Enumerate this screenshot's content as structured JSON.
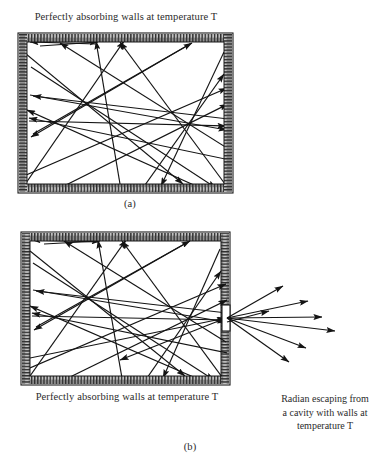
{
  "figure": {
    "title_top": "Perfectly absorbing walls at temperature T",
    "label_a": "(a)",
    "title_bottom": "Perfectly absorbing walls at temperature T",
    "label_b": "(b)",
    "escape_line1": "Radian escaping from",
    "escape_line2": "a cavity with walls at",
    "escape_line3": "temperature T"
  },
  "colors": {
    "ink": "#1a1a1a",
    "text": "#2b2b2b",
    "wall_fill": "#b9b9b9",
    "wall_hatch": "#2a2a2a",
    "cavity_fill": "#ffffff",
    "background": "#ffffff"
  },
  "chart_data": {
    "type": "diagram",
    "panels": [
      {
        "id": "a",
        "label": "(a)",
        "caption": "Perfectly absorbing walls at temperature T",
        "box": {
          "x": 18,
          "y": 33,
          "w": 215,
          "h": 160
        },
        "wall_thickness": 9,
        "aperture": null,
        "description": "Closed cavity with perfectly absorbing walls; radiation rays reflect internally and none escape.",
        "rays": [
          {
            "x1": 96,
            "y1": 44,
            "x2": 30,
            "y2": 42
          },
          {
            "x1": 26,
            "y1": 54,
            "x2": 183,
            "y2": 184
          },
          {
            "x1": 40,
            "y1": 46,
            "x2": 98,
            "y2": 42
          },
          {
            "x1": 120,
            "y1": 184,
            "x2": 96,
            "y2": 41
          },
          {
            "x1": 31,
            "y1": 67,
            "x2": 216,
            "y2": 188
          },
          {
            "x1": 26,
            "y1": 183,
            "x2": 124,
            "y2": 41
          },
          {
            "x1": 224,
            "y1": 52,
            "x2": 161,
            "y2": 186
          },
          {
            "x1": 30,
            "y1": 95,
            "x2": 227,
            "y2": 130
          },
          {
            "x1": 228,
            "y1": 119,
            "x2": 33,
            "y2": 96
          },
          {
            "x1": 190,
            "y1": 44,
            "x2": 31,
            "y2": 137
          },
          {
            "x1": 33,
            "y1": 134,
            "x2": 192,
            "y2": 43
          },
          {
            "x1": 26,
            "y1": 175,
            "x2": 227,
            "y2": 88
          },
          {
            "x1": 225,
            "y1": 184,
            "x2": 120,
            "y2": 42
          },
          {
            "x1": 145,
            "y1": 185,
            "x2": 224,
            "y2": 74
          },
          {
            "x1": 29,
            "y1": 121,
            "x2": 226,
            "y2": 126
          },
          {
            "x1": 227,
            "y1": 148,
            "x2": 60,
            "y2": 43
          },
          {
            "x1": 62,
            "y1": 187,
            "x2": 228,
            "y2": 104
          },
          {
            "x1": 230,
            "y1": 160,
            "x2": 29,
            "y2": 118
          },
          {
            "x1": 196,
            "y1": 186,
            "x2": 27,
            "y2": 110
          }
        ]
      },
      {
        "id": "b",
        "label": "(b)",
        "caption": "Perfectly absorbing walls at temperature T",
        "box": {
          "x": 21,
          "y": 232,
          "w": 209,
          "h": 153
        },
        "wall_thickness": 9,
        "aperture": {
          "x": 222,
          "y": 305,
          "w": 8,
          "h": 26
        },
        "escape_caption": "Radian escaping from a cavity with walls at temperature T",
        "description": "Cavity with a small aperture in the right wall; internal rays converge on the hole and escape as a fan of radiation.",
        "rays": [
          {
            "x1": 98,
            "y1": 242,
            "x2": 32,
            "y2": 240
          },
          {
            "x1": 30,
            "y1": 251,
            "x2": 185,
            "y2": 376
          },
          {
            "x1": 44,
            "y1": 244,
            "x2": 100,
            "y2": 241
          },
          {
            "x1": 122,
            "y1": 378,
            "x2": 98,
            "y2": 240
          },
          {
            "x1": 33,
            "y1": 263,
            "x2": 214,
            "y2": 380
          },
          {
            "x1": 30,
            "y1": 376,
            "x2": 126,
            "y2": 240
          },
          {
            "x1": 220,
            "y1": 249,
            "x2": 163,
            "y2": 378
          },
          {
            "x1": 33,
            "y1": 290,
            "x2": 226,
            "y2": 322
          },
          {
            "x1": 227,
            "y1": 313,
            "x2": 36,
            "y2": 291
          },
          {
            "x1": 188,
            "y1": 242,
            "x2": 34,
            "y2": 330
          },
          {
            "x1": 36,
            "y1": 327,
            "x2": 190,
            "y2": 241
          },
          {
            "x1": 30,
            "y1": 368,
            "x2": 226,
            "y2": 284
          },
          {
            "x1": 222,
            "y1": 377,
            "x2": 122,
            "y2": 241
          },
          {
            "x1": 147,
            "y1": 378,
            "x2": 221,
            "y2": 271
          },
          {
            "x1": 32,
            "y1": 316,
            "x2": 225,
            "y2": 320
          },
          {
            "x1": 226,
            "y1": 342,
            "x2": 64,
            "y2": 241
          },
          {
            "x1": 66,
            "y1": 379,
            "x2": 227,
            "y2": 300
          },
          {
            "x1": 228,
            "y1": 353,
            "x2": 32,
            "y2": 313
          },
          {
            "x1": 198,
            "y1": 379,
            "x2": 30,
            "y2": 306
          },
          {
            "x1": 30,
            "y1": 358,
            "x2": 226,
            "y2": 318
          },
          {
            "x1": 226,
            "y1": 318,
            "x2": 120,
            "y2": 360
          }
        ],
        "escaping_rays": [
          {
            "x1": 227,
            "y1": 318,
            "x2": 283,
            "y2": 286
          },
          {
            "x1": 227,
            "y1": 318,
            "x2": 308,
            "y2": 301
          },
          {
            "x1": 227,
            "y1": 318,
            "x2": 322,
            "y2": 317
          },
          {
            "x1": 227,
            "y1": 318,
            "x2": 335,
            "y2": 331
          },
          {
            "x1": 227,
            "y1": 318,
            "x2": 306,
            "y2": 348
          },
          {
            "x1": 227,
            "y1": 318,
            "x2": 289,
            "y2": 362
          },
          {
            "x1": 227,
            "y1": 322,
            "x2": 269,
            "y2": 311
          }
        ]
      }
    ]
  }
}
